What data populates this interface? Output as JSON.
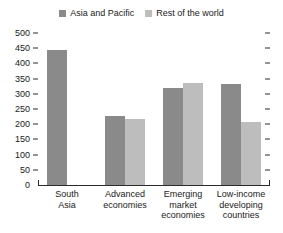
{
  "chart_data": {
    "type": "bar",
    "title": "",
    "subtitle": "",
    "xlabel": "",
    "ylabel": "",
    "ylim": [
      0,
      500
    ],
    "ytick_step": 50,
    "yticks": [
      "500",
      "450",
      "400",
      "350",
      "300",
      "250",
      "200",
      "150",
      "100",
      "50",
      "0"
    ],
    "grid": false,
    "legend_position": "top-center",
    "categories": [
      "South Asia",
      "Advanced economies",
      "Emerging market economies",
      "Low-income developing countries"
    ],
    "category_lines": [
      [
        "South",
        "Asia"
      ],
      [
        "Advanced",
        "economies"
      ],
      [
        "Emerging",
        "market",
        "economies"
      ],
      [
        "Low-income",
        "developing",
        "countries"
      ]
    ],
    "series": [
      {
        "name": "Asia and Pacific",
        "color": "#8a8a8a",
        "values": [
          444,
          227,
          319,
          332
        ]
      },
      {
        "name": "Rest of the world",
        "color": "#bdbdbd",
        "values": [
          null,
          217,
          335,
          207
        ]
      }
    ]
  },
  "legend": {
    "entries": [
      {
        "label": "Asia and Pacific",
        "color": "#8a8a8a"
      },
      {
        "label": "Rest of the world",
        "color": "#bdbdbd"
      }
    ]
  },
  "axis": {
    "left_ticks_labeled": true,
    "right_ticks_labeled": false
  }
}
